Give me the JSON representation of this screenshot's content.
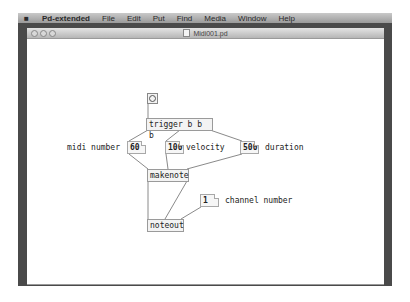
{
  "menubar": {
    "apple": "",
    "app_name": "Pd-extended",
    "items": [
      "File",
      "Edit",
      "Put",
      "Find",
      "Media",
      "Window",
      "Help"
    ]
  },
  "window": {
    "title": "Midi001.pd",
    "traffic_lights": [
      "close",
      "minimize",
      "zoom"
    ]
  },
  "patch": {
    "bang": {
      "type": "bng"
    },
    "trigger": {
      "label": "trigger b b b"
    },
    "number_midi": {
      "value": "60"
    },
    "number_velocity": {
      "value": "100"
    },
    "number_duration": {
      "value": "500"
    },
    "number_channel": {
      "value": "1"
    },
    "makenote": {
      "label": "makenote"
    },
    "noteout": {
      "label": "noteout"
    },
    "comments": {
      "midi_number": "midi number",
      "velocity": "velocity",
      "duration": "duration",
      "channel_number": "channel number"
    }
  }
}
